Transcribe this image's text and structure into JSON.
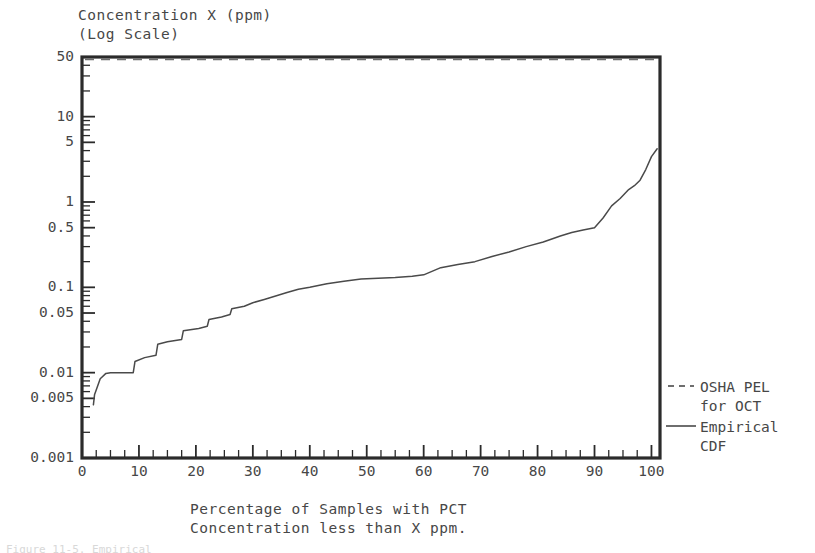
{
  "figure": {
    "y_axis_title_line1": "Concentration X (ppm)",
    "y_axis_title_line2": "(Log Scale)",
    "x_axis_title_line1": "Percentage of Samples with PCT",
    "x_axis_title_line2": "Concentration less than X ppm.",
    "caption_sliver": "Figure 11-5. Empirical"
  },
  "legend": {
    "osha_line1": "OSHA PEL",
    "osha_line2": "for OCT",
    "cdf_line1": "Empirical",
    "cdf_line2": "CDF",
    "osha_style": "dashed",
    "cdf_style": "solid"
  },
  "colors": {
    "axis": "#2b2b2b",
    "curve": "#4a4a4a",
    "osha": "#6e6e6e",
    "text": "#474747",
    "background": "#ffffff"
  },
  "chart_data": {
    "type": "line",
    "title": "",
    "xlabel": "Percentage of Samples with PCT Concentration less than X ppm.",
    "ylabel": "Concentration X (ppm) (Log Scale)",
    "yscale": "log",
    "xscale": "linear",
    "xlim": [
      0,
      101.5
    ],
    "ylim": [
      0.001,
      50
    ],
    "grid": false,
    "legend_position": "right",
    "xticks": [
      0,
      10,
      20,
      30,
      40,
      50,
      60,
      70,
      80,
      90,
      100
    ],
    "xtick_labels": [
      "0",
      "10",
      "20",
      "30",
      "40",
      "50",
      "60",
      "70",
      "80",
      "90",
      "100"
    ],
    "yticks": [
      50,
      10,
      5,
      1,
      0.5,
      0.1,
      0.05,
      0.01,
      0.005,
      0.001
    ],
    "ytick_labels": [
      "50",
      "10",
      "5",
      "1",
      "0.5",
      "0.1",
      "0.05",
      "0.01",
      "0.005",
      "0.001"
    ],
    "y_minor_ticks": [
      40,
      30,
      20,
      9,
      8,
      7,
      6,
      4,
      3,
      2,
      0.9,
      0.8,
      0.7,
      0.6,
      0.4,
      0.3,
      0.2,
      0.09,
      0.08,
      0.07,
      0.06,
      0.04,
      0.03,
      0.02,
      0.009,
      0.008,
      0.007,
      0.006,
      0.004,
      0.003,
      0.002
    ],
    "x_minor_ticks": [
      2.5,
      5,
      7.5,
      12.5,
      15,
      17.5,
      22.5,
      25,
      27.5,
      32.5,
      35,
      37.5,
      42.5,
      45,
      47.5,
      52.5,
      55,
      57.5,
      62.5,
      65,
      67.5,
      72.5,
      75,
      77.5,
      82.5,
      85,
      87.5,
      92.5,
      95,
      97.5
    ],
    "series": [
      {
        "name": "OSHA PEL for OCT",
        "style": "dashed",
        "type": "hline",
        "y_value": 47,
        "x": [
          0,
          101.5
        ],
        "values": [
          47,
          47
        ]
      },
      {
        "name": "Empirical CDF",
        "style": "solid",
        "type": "step-line",
        "x": [
          2.0,
          2.2,
          3.2,
          4.2,
          5.0,
          9.0,
          9.3,
          11.0,
          13.0,
          13.3,
          15.0,
          17.5,
          17.8,
          20.5,
          22.0,
          22.3,
          24.5,
          26.0,
          26.3,
          28.5,
          30.0,
          32.0,
          34.0,
          36.0,
          38.0,
          40.0,
          43.0,
          46.0,
          49.0,
          52.0,
          55.0,
          58.0,
          60.0,
          63.0,
          66.0,
          69.0,
          72.0,
          75.0,
          78.0,
          81.0,
          84.0,
          86.0,
          88.0,
          90.0,
          91.5,
          93.0,
          94.5,
          96.0,
          97.0,
          98.0,
          99.0,
          100.0,
          101.0
        ],
        "values": [
          0.0042,
          0.0055,
          0.0085,
          0.0098,
          0.01,
          0.01,
          0.0135,
          0.015,
          0.016,
          0.0215,
          0.023,
          0.0245,
          0.031,
          0.033,
          0.035,
          0.042,
          0.045,
          0.048,
          0.056,
          0.06,
          0.066,
          0.072,
          0.079,
          0.087,
          0.095,
          0.1,
          0.11,
          0.118,
          0.125,
          0.128,
          0.13,
          0.135,
          0.14,
          0.17,
          0.185,
          0.2,
          0.23,
          0.26,
          0.3,
          0.34,
          0.4,
          0.44,
          0.47,
          0.5,
          0.65,
          0.9,
          1.1,
          1.4,
          1.55,
          1.8,
          2.4,
          3.4,
          4.2
        ]
      }
    ]
  }
}
